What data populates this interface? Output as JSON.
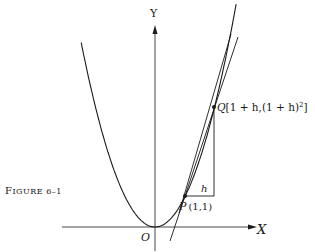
{
  "figure": {
    "caption": "Figure 6–1",
    "caption_small": "IGURE 6–1",
    "caption_first": "F",
    "axes": {
      "x_label": "X",
      "y_label": "Y",
      "origin_label": "O"
    },
    "curve": "y = x^2",
    "points": {
      "P": {
        "label": "P",
        "coords": "(1,1)"
      },
      "Q": {
        "label": "Q",
        "coords": "[1 + h,(1 + h)",
        "coords_sup": "2",
        "coords_end": "]"
      }
    },
    "increment_label": "h",
    "colors": {
      "ink": "#1a1a1a",
      "background": "#ffffff"
    }
  }
}
